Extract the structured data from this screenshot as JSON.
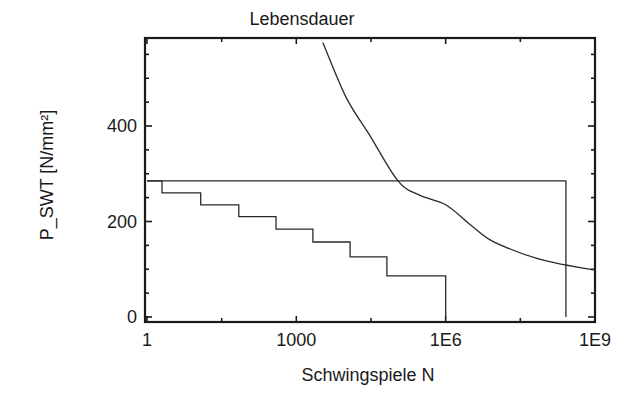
{
  "chart_data": {
    "type": "line",
    "title": "Lebensdauer",
    "xlabel": "Schwingspiele N",
    "ylabel": "P_SWT [N/mm²]",
    "xscale": "log",
    "xlim": [
      1,
      1000000000
    ],
    "ylim": [
      0,
      587
    ],
    "x_ticks": [
      {
        "value": 1,
        "label": "1"
      },
      {
        "value": 1000,
        "label": "1000"
      },
      {
        "value": 1000000,
        "label": "1E6"
      },
      {
        "value": 1000000000,
        "label": "1E9"
      }
    ],
    "x_minor_ticks": [
      31.6,
      31623,
      31622777
    ],
    "y_ticks": [
      {
        "value": 0,
        "label": "0"
      },
      {
        "value": 200,
        "label": "200"
      },
      {
        "value": 400,
        "label": "400"
      }
    ],
    "y_minor_ticks": [
      50,
      100,
      150,
      250,
      300,
      350,
      450,
      500,
      550
    ],
    "grid": false,
    "legend": null,
    "series": [
      {
        "name": "Lastkollektiv (Stufen)",
        "style": "step",
        "points": [
          [
            1,
            285
          ],
          [
            2,
            285
          ],
          [
            2,
            260
          ],
          [
            12,
            260
          ],
          [
            12,
            235
          ],
          [
            70,
            235
          ],
          [
            70,
            210
          ],
          [
            390,
            210
          ],
          [
            390,
            184
          ],
          [
            2150,
            184
          ],
          [
            2150,
            157
          ],
          [
            12000,
            157
          ],
          [
            12000,
            126
          ],
          [
            66000,
            126
          ],
          [
            66000,
            86
          ],
          [
            1000000,
            86
          ],
          [
            1000000,
            0
          ]
        ]
      },
      {
        "name": "Hoechstlast (Rechteck)",
        "style": "step",
        "points": [
          [
            1,
            285
          ],
          [
            260000000,
            285
          ],
          [
            260000000,
            0
          ]
        ]
      },
      {
        "name": "Woehlerlinie",
        "style": "curve",
        "points": [
          [
            3400,
            575
          ],
          [
            10000,
            460
          ],
          [
            30000,
            380
          ],
          [
            110000,
            285
          ],
          [
            300000,
            255
          ],
          [
            1000000,
            235
          ],
          [
            3000000,
            195
          ],
          [
            8000000,
            161
          ],
          [
            30000000,
            135
          ],
          [
            100000000,
            118
          ],
          [
            260000000,
            109
          ],
          [
            1000000000,
            98
          ]
        ]
      }
    ]
  }
}
